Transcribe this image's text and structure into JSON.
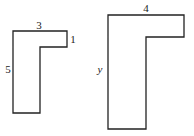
{
  "diagram": {
    "stroke_color": "#222222",
    "background": "#ffffff",
    "shapes": [
      {
        "name": "small-l-shape",
        "points": "13,31 67,31 67,47 40,47 40,113 13,113",
        "labels": [
          {
            "name": "top-width-label",
            "text": "3",
            "x": 39,
            "y": 29
          },
          {
            "name": "notch-height-label",
            "text": "1",
            "x": 73,
            "y": 43
          },
          {
            "name": "left-height-label",
            "text": "5",
            "x": 8,
            "y": 73
          }
        ]
      },
      {
        "name": "large-l-shape",
        "points": "108,15 184,15 184,37 146,37 146,129 108,129",
        "labels": [
          {
            "name": "top-width-label",
            "text": "4",
            "x": 146,
            "y": 12
          },
          {
            "name": "left-height-label",
            "text": "y",
            "x": 100,
            "y": 73
          }
        ]
      }
    ]
  }
}
